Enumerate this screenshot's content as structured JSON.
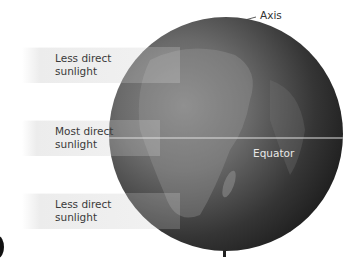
{
  "diagram": {
    "labels": {
      "axis": "Axis",
      "equator": "Equator"
    },
    "beams": [
      {
        "line1": "Less direct",
        "line2": "sunlight"
      },
      {
        "line1": "Most direct",
        "line2": "sunlight"
      },
      {
        "line1": "Less direct",
        "line2": "sunlight"
      }
    ],
    "colors": {
      "globe_dark": "#1c1c1c",
      "globe_light": "#7a7a7a",
      "beam": "#ececec",
      "equator_line": "#e0e0e0",
      "axis": "#222222"
    }
  }
}
